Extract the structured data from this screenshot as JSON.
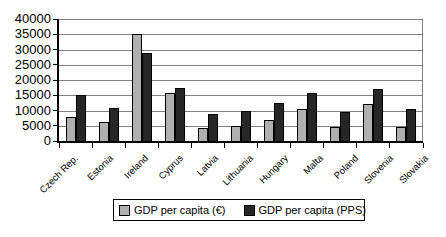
{
  "chart_data": {
    "type": "bar",
    "title": "",
    "xlabel": "",
    "ylabel": "",
    "categories": [
      "Czech Rep.",
      "Estonia",
      "Ireland",
      "Cyprus",
      "Latvia",
      "Lithuania",
      "Hungary",
      "Malta",
      "Poland",
      "Slovenia",
      "Slovakia"
    ],
    "series": [
      {
        "name": "GDP per capita (€)",
        "color": "#b0b0b0",
        "values": [
          7900,
          6200,
          35000,
          15700,
          4300,
          5000,
          7000,
          10400,
          4600,
          12100,
          4700
        ]
      },
      {
        "name": "GDP per capita (PPS)",
        "color": "#262626",
        "values": [
          15200,
          10700,
          29000,
          17500,
          8900,
          10000,
          12400,
          15800,
          9600,
          17000,
          10500
        ]
      }
    ],
    "ylim": [
      0,
      40000
    ],
    "ytick_interval": 5000,
    "ytick_labels": [
      "0",
      "5000",
      "10000",
      "15000",
      "20000",
      "25000",
      "30000",
      "35000",
      "40000"
    ],
    "grid": "horizontal",
    "legend_position": "bottom-center"
  },
  "colors": {
    "background": "#ffffff",
    "gridline": "#808080",
    "axis": "#000000",
    "text": "#000000"
  }
}
